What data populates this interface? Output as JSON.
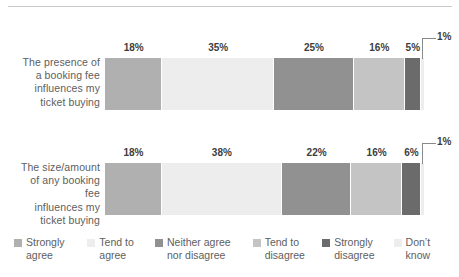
{
  "chart_data": {
    "type": "bar",
    "orientation": "horizontal",
    "stacked": true,
    "stacked_percent": true,
    "title": "",
    "subtitle": "",
    "xlabel": "",
    "ylabel": "",
    "xlim": [
      0,
      100
    ],
    "grid": false,
    "legend_position": "bottom",
    "categories": [
      "The presence of a booking fee influences my ticket buying",
      "The size/amount of any booking fee influences my ticket buying"
    ],
    "series": [
      {
        "name": "Strongly agree",
        "color": "#b0b0b0",
        "values": [
          18,
          18
        ]
      },
      {
        "name": "Tend to agree",
        "color": "#ededed",
        "values": [
          35,
          38
        ]
      },
      {
        "name": "Neither agree nor disagree",
        "color": "#919191",
        "values": [
          25,
          22
        ]
      },
      {
        "name": "Tend to disagree",
        "color": "#c4c4c4",
        "values": [
          16,
          16
        ]
      },
      {
        "name": "Strongly disagree",
        "color": "#6b6b6b",
        "values": [
          5,
          6
        ]
      },
      {
        "name": "Don't know",
        "color": "#ededed",
        "values": [
          1,
          1
        ]
      }
    ],
    "value_label_suffix": "%"
  },
  "bars": [
    {
      "label_lines": [
        "The presence of",
        "a booking fee",
        "influences my",
        "ticket buying"
      ],
      "segments": [
        {
          "key": "strongly-agree",
          "label": "18%",
          "value": 18,
          "color": "#b0b0b0",
          "show_label": true
        },
        {
          "key": "tend-to-agree",
          "label": "35%",
          "value": 35,
          "color": "#ededed",
          "show_label": true
        },
        {
          "key": "neither-agree-nor-disagree",
          "label": "25%",
          "value": 25,
          "color": "#919191",
          "show_label": true
        },
        {
          "key": "tend-to-disagree",
          "label": "16%",
          "value": 16,
          "color": "#c4c4c4",
          "show_label": true
        },
        {
          "key": "strongly-disagree",
          "label": "5%",
          "value": 5,
          "color": "#6b6b6b",
          "show_label": true
        },
        {
          "key": "dont-know",
          "label": "1%",
          "value": 1,
          "color": "#ededed",
          "show_label": false
        }
      ],
      "callout": "1%"
    },
    {
      "label_lines": [
        "The size/amount",
        "of any booking fee",
        "influences my",
        "ticket buying"
      ],
      "segments": [
        {
          "key": "strongly-agree",
          "label": "18%",
          "value": 18,
          "color": "#b0b0b0",
          "show_label": true
        },
        {
          "key": "tend-to-agree",
          "label": "38%",
          "value": 38,
          "color": "#ededed",
          "show_label": true
        },
        {
          "key": "neither-agree-nor-disagree",
          "label": "22%",
          "value": 22,
          "color": "#919191",
          "show_label": true
        },
        {
          "key": "tend-to-disagree",
          "label": "16%",
          "value": 16,
          "color": "#c4c4c4",
          "show_label": true
        },
        {
          "key": "strongly-disagree",
          "label": "6%",
          "value": 6,
          "color": "#6b6b6b",
          "show_label": true
        },
        {
          "key": "dont-know",
          "label": "1%",
          "value": 1,
          "color": "#ededed",
          "show_label": false
        }
      ],
      "callout": "1%"
    }
  ],
  "legend": {
    "items": [
      {
        "key": "strongly-agree",
        "label": "Strongly\nagree",
        "color": "#b0b0b0"
      },
      {
        "key": "tend-to-agree",
        "label": "Tend to\nagree",
        "color": "#ededed"
      },
      {
        "key": "neither-agree-nor-disagree",
        "label": "Neither agree\nnor disagree",
        "color": "#919191"
      },
      {
        "key": "tend-to-disagree",
        "label": "Tend to\ndisagree",
        "color": "#c4c4c4"
      },
      {
        "key": "strongly-disagree",
        "label": "Strongly\ndisagree",
        "color": "#6b6b6b"
      },
      {
        "key": "dont-know",
        "label": "Don’t\nknow",
        "color": "#ededed"
      }
    ]
  },
  "colors": {
    "rule": "#c9c9c9",
    "text": "#5e5e5e",
    "value_text": "#3d3d3d",
    "callout_line": "#8a8a8a",
    "background": "#ffffff"
  }
}
